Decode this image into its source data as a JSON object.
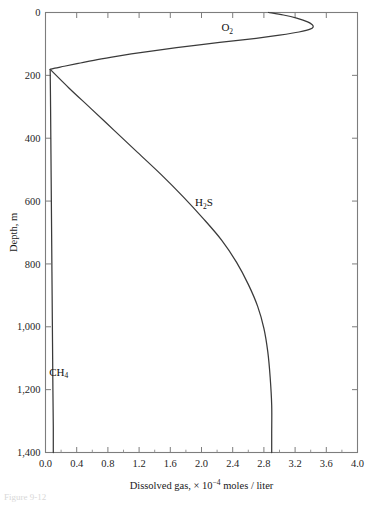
{
  "figure": {
    "caption": "Figure 9-12"
  },
  "chart_data": {
    "type": "line",
    "title": "",
    "xlabel_parts": {
      "lead": "Dissolved gas, ",
      "times": "× 10",
      "exponent": "−4",
      "trail": " moles / liter"
    },
    "xlabel": "Dissolved gas, × 10−4 moles / liter",
    "ylabel": "Depth, m",
    "xlim": [
      0.0,
      4.0
    ],
    "ylim": [
      0,
      1400
    ],
    "y_inverted": true,
    "grid": false,
    "legend": "inline-annotations",
    "x_ticks": [
      0.0,
      0.4,
      0.8,
      1.2,
      1.6,
      2.0,
      2.4,
      2.8,
      3.2,
      3.6,
      4.0
    ],
    "x_tick_labels": [
      "0.0",
      "0.4",
      "0.8",
      "1.2",
      "1.6",
      "2.0",
      "2.4",
      "2.8",
      "3.2",
      "3.6",
      "4.0"
    ],
    "x_minor_ticks": [
      0.2,
      0.6,
      1.0,
      1.4,
      1.8,
      2.2,
      2.6,
      3.0,
      3.4,
      3.8
    ],
    "y_ticks": [
      0,
      200,
      400,
      600,
      800,
      1000,
      1200,
      1400
    ],
    "y_tick_labels": [
      "0",
      "200",
      "400",
      "600",
      "800",
      "1,000",
      "1,200",
      "1,400"
    ],
    "series": [
      {
        "name": "O2",
        "label_html": "O<sub>2</sub>",
        "label_text": "O2",
        "label_x": 2.33,
        "label_y": 60,
        "points": [
          [
            2.86,
            0
          ],
          [
            3.05,
            8
          ],
          [
            3.22,
            18
          ],
          [
            3.36,
            30
          ],
          [
            3.43,
            42
          ],
          [
            3.4,
            52
          ],
          [
            3.25,
            62
          ],
          [
            3.0,
            72
          ],
          [
            2.7,
            82
          ],
          [
            2.35,
            92
          ],
          [
            2.0,
            102
          ],
          [
            1.68,
            112
          ],
          [
            1.38,
            122
          ],
          [
            1.1,
            132
          ],
          [
            0.85,
            142
          ],
          [
            0.62,
            152
          ],
          [
            0.42,
            162
          ],
          [
            0.24,
            171
          ],
          [
            0.12,
            177
          ],
          [
            0.06,
            181
          ]
        ]
      },
      {
        "name": "H2S",
        "label_html": "H<sub>2</sub>S",
        "label_x": 2.03,
        "label_y": 617,
        "points": [
          [
            0.06,
            181
          ],
          [
            0.3,
            240
          ],
          [
            0.58,
            305
          ],
          [
            0.88,
            375
          ],
          [
            1.18,
            445
          ],
          [
            1.48,
            515
          ],
          [
            1.76,
            585
          ],
          [
            2.02,
            655
          ],
          [
            2.26,
            725
          ],
          [
            2.45,
            795
          ],
          [
            2.6,
            865
          ],
          [
            2.72,
            935
          ],
          [
            2.8,
            1005
          ],
          [
            2.85,
            1080
          ],
          [
            2.88,
            1160
          ],
          [
            2.9,
            1250
          ],
          [
            2.9,
            1340
          ],
          [
            2.9,
            1400
          ]
        ]
      },
      {
        "name": "CH4",
        "label_html": "CH<sub>4</sub>",
        "label_x": 0.17,
        "label_y": 1155,
        "points": [
          [
            0.06,
            181
          ],
          [
            0.065,
            300
          ],
          [
            0.07,
            450
          ],
          [
            0.075,
            600
          ],
          [
            0.08,
            750
          ],
          [
            0.085,
            900
          ],
          [
            0.09,
            1050
          ],
          [
            0.095,
            1200
          ],
          [
            0.1,
            1320
          ],
          [
            0.1,
            1400
          ]
        ]
      }
    ]
  }
}
